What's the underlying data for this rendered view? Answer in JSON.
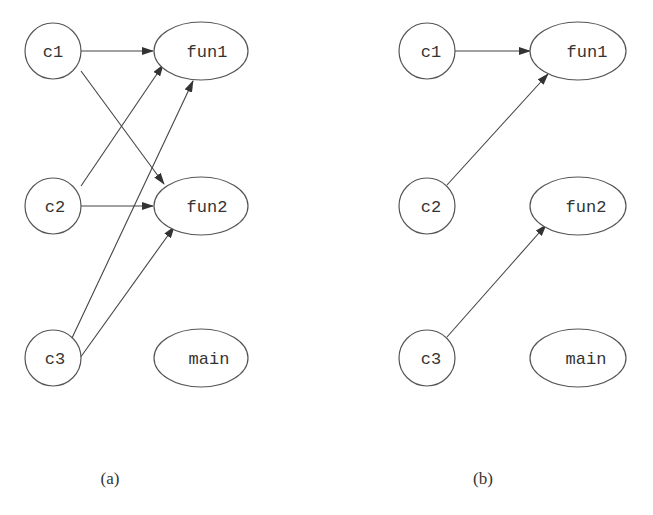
{
  "panels": [
    {
      "caption": "(a)",
      "nodes": {
        "c1": "c1",
        "c2": "c2",
        "c3": "c3",
        "fun1": "fun1",
        "fun2": "fun2",
        "main": "main"
      },
      "edges": [
        {
          "from": "c1",
          "to": "fun1"
        },
        {
          "from": "c1",
          "to": "fun2"
        },
        {
          "from": "c2",
          "to": "fun1"
        },
        {
          "from": "c2",
          "to": "fun2"
        },
        {
          "from": "c3",
          "to": "fun1"
        },
        {
          "from": "c3",
          "to": "fun2"
        }
      ]
    },
    {
      "caption": "(b)",
      "nodes": {
        "c1": "c1",
        "c2": "c2",
        "c3": "c3",
        "fun1": "fun1",
        "fun2": "fun2",
        "main": "main"
      },
      "edges": [
        {
          "from": "c1",
          "to": "fun1"
        },
        {
          "from": "c2",
          "to": "fun1"
        },
        {
          "from": "c3",
          "to": "fun2"
        }
      ]
    }
  ]
}
